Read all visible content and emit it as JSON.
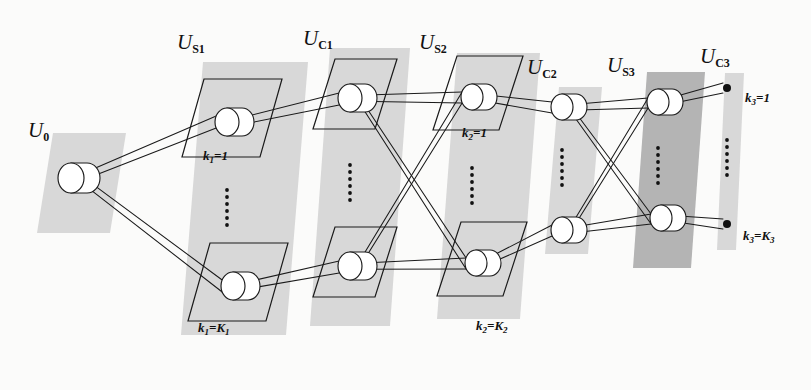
{
  "figure": {
    "background_color": "#fbfbfa",
    "panel_fill_light": "#d8d8d8",
    "panel_fill_dark": "#b4b4b4",
    "line_color": "#1a1a1a",
    "node_fill": "#ffffff",
    "dot_color": "#111111"
  },
  "layers": [
    {
      "id": "U0",
      "label": "U",
      "sub": "0",
      "label_x": 28,
      "label_y": 118,
      "panel": {
        "x": 37,
        "y": 133,
        "w": 73,
        "h": 100,
        "shear": 16,
        "shade": "light"
      },
      "planes": []
    },
    {
      "id": "US1",
      "label": "U",
      "sub": "S1",
      "label_x": 177,
      "label_y": 30,
      "panel": {
        "x": 181,
        "y": 62,
        "w": 105,
        "h": 273,
        "shear": 22,
        "shade": "light"
      },
      "planes": []
    },
    {
      "id": "UC1",
      "label": "U",
      "sub": "C1",
      "label_x": 303,
      "label_y": 26,
      "panel": {
        "x": 310,
        "y": 48,
        "w": 80,
        "h": 278,
        "shear": 20,
        "shade": "light"
      },
      "planes": []
    },
    {
      "id": "US2",
      "label": "U",
      "sub": "S2",
      "label_x": 419,
      "label_y": 30,
      "panel": {
        "x": 437,
        "y": 53,
        "w": 83,
        "h": 266,
        "shear": 20,
        "shade": "light"
      },
      "planes": []
    },
    {
      "id": "UC2",
      "label": "U",
      "sub": "C2",
      "label_x": 527,
      "label_y": 55,
      "panel": {
        "x": 545,
        "y": 87,
        "w": 43,
        "h": 167,
        "shear": 14,
        "shade": "light"
      },
      "planes": []
    },
    {
      "id": "US3",
      "label": "U",
      "sub": "S3",
      "label_x": 607,
      "label_y": 53,
      "panel": {
        "x": 633,
        "y": 72,
        "w": 58,
        "h": 196,
        "shear": 14,
        "shade": "dark"
      },
      "planes": []
    },
    {
      "id": "UC3",
      "label": "U",
      "sub": "C3",
      "label_x": 700,
      "label_y": 44,
      "panel": {
        "x": 717,
        "y": 73,
        "w": 19,
        "h": 177,
        "shear": 8,
        "shade": "light"
      },
      "planes": []
    }
  ],
  "plane_labels": [
    {
      "text": "k",
      "sub": "1",
      "eq": "=1",
      "x": 203,
      "y": 148
    },
    {
      "text": "k",
      "sub": "1",
      "eq": "=K",
      "sub2": "1",
      "x": 198,
      "y": 320
    },
    {
      "text": "k",
      "sub": "2",
      "eq": "=1",
      "x": 462,
      "y": 125
    },
    {
      "text": "k",
      "sub": "2",
      "eq": "=K",
      "sub2": "2",
      "x": 476,
      "y": 318
    },
    {
      "text": "k",
      "sub": "3",
      "eq": "=1",
      "x": 745,
      "y": 90
    },
    {
      "text": "k",
      "sub": "3",
      "eq": "=K",
      "sub2": "3",
      "x": 743,
      "y": 228
    }
  ],
  "nodes": [
    {
      "layer": "U0",
      "position": "single",
      "cx": 71,
      "cy": 178,
      "rx": 13,
      "ry": 15,
      "depth": 16,
      "style": "cylinder"
    },
    {
      "layer": "US1",
      "position": "top",
      "cx": 227,
      "cy": 122,
      "rx": 12,
      "ry": 14,
      "depth": 15,
      "style": "cylinder"
    },
    {
      "layer": "US1",
      "position": "bottom",
      "cx": 233,
      "cy": 286,
      "rx": 12,
      "ry": 14,
      "depth": 15,
      "style": "cylinder"
    },
    {
      "layer": "UC1",
      "position": "top",
      "cx": 350,
      "cy": 98,
      "rx": 12,
      "ry": 14,
      "depth": 15,
      "style": "cylinder"
    },
    {
      "layer": "UC1",
      "position": "bottom",
      "cx": 350,
      "cy": 266,
      "rx": 12,
      "ry": 14,
      "depth": 15,
      "style": "cylinder"
    },
    {
      "layer": "US2",
      "position": "top",
      "cx": 472,
      "cy": 97,
      "rx": 11,
      "ry": 13,
      "depth": 14,
      "style": "cylinder"
    },
    {
      "layer": "US2",
      "position": "bottom",
      "cx": 476,
      "cy": 263,
      "rx": 11,
      "ry": 13,
      "depth": 14,
      "style": "cylinder"
    },
    {
      "layer": "UC2",
      "position": "top",
      "cx": 562,
      "cy": 107,
      "rx": 11,
      "ry": 13,
      "depth": 14,
      "style": "cylinder"
    },
    {
      "layer": "UC2",
      "position": "bottom",
      "cx": 562,
      "cy": 230,
      "rx": 11,
      "ry": 13,
      "depth": 14,
      "style": "cylinder"
    },
    {
      "layer": "US3",
      "position": "top",
      "cx": 658,
      "cy": 102,
      "rx": 11,
      "ry": 13,
      "depth": 14,
      "style": "cylinder"
    },
    {
      "layer": "US3",
      "position": "bottom",
      "cx": 661,
      "cy": 218,
      "rx": 11,
      "ry": 13,
      "depth": 14,
      "style": "cylinder"
    },
    {
      "layer": "UC3",
      "position": "top",
      "cx": 727,
      "cy": 88,
      "r": 4,
      "style": "dot"
    },
    {
      "layer": "UC3",
      "position": "bottom",
      "cx": 727,
      "cy": 224,
      "r": 4,
      "style": "dot"
    }
  ],
  "ellipses_dots": [
    {
      "layer": "US1",
      "x": 227,
      "y_start": 190,
      "count": 6,
      "spacing": 7
    },
    {
      "layer": "UC1",
      "x": 350,
      "y_start": 165,
      "count": 6,
      "spacing": 7
    },
    {
      "layer": "US2",
      "x": 472,
      "y_start": 168,
      "count": 6,
      "spacing": 7
    },
    {
      "layer": "UC2",
      "x": 562,
      "y_start": 150,
      "count": 6,
      "spacing": 7
    },
    {
      "layer": "US3",
      "x": 658,
      "y_start": 148,
      "count": 6,
      "spacing": 7
    },
    {
      "layer": "UC3",
      "x": 727,
      "y_start": 140,
      "count": 6,
      "spacing": 7
    }
  ]
}
